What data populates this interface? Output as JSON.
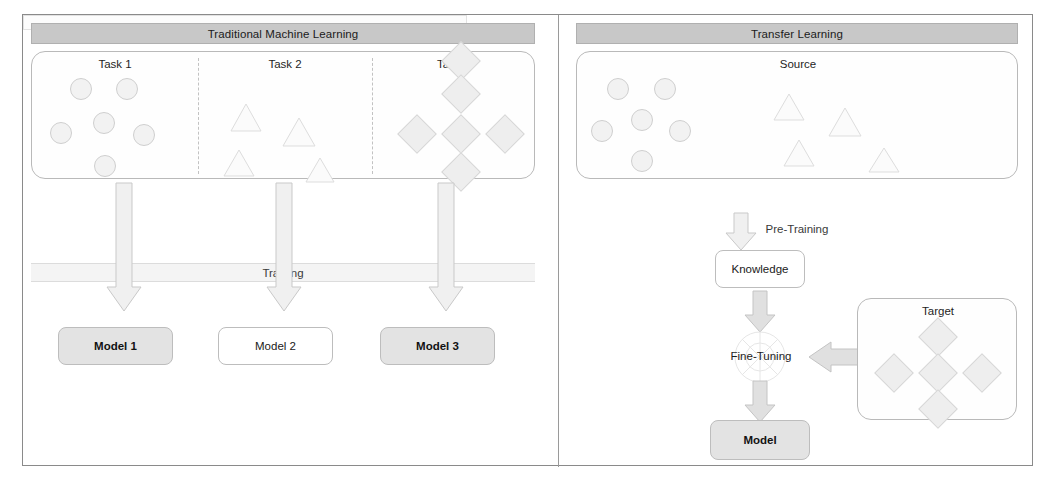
{
  "figure": {
    "panels": [
      {
        "id": "traditional",
        "title": "Traditional Machine Learning",
        "process_label": "Training",
        "tasks": [
          {
            "label": "Task 1",
            "shape": "circle",
            "count": 6
          },
          {
            "label": "Task 2",
            "shape": "triangle",
            "count": 4
          },
          {
            "label": "Task 3",
            "shape": "diamond",
            "count": 5
          }
        ],
        "outputs": [
          {
            "label": "Model 1"
          },
          {
            "label": "Model 2"
          },
          {
            "label": "Model 3"
          }
        ]
      },
      {
        "id": "transfer",
        "title": "Transfer Learning",
        "source": {
          "label": "Source",
          "circles": 6,
          "triangles": 4
        },
        "target": {
          "label": "Target",
          "diamonds": 5
        },
        "pre_training_label": "Pre-Training",
        "knowledge_label": "Knowledge",
        "fine_tuning_label": "Fine-Tuning",
        "model_label": "Model"
      }
    ],
    "colors": {
      "header_bar": "#c8c8c8",
      "frame_border": "#8a8a8a",
      "shape_fill": "#f2f2f2",
      "shaded_node": "#e3e3e3",
      "arrow": "#f0f0f0"
    }
  }
}
